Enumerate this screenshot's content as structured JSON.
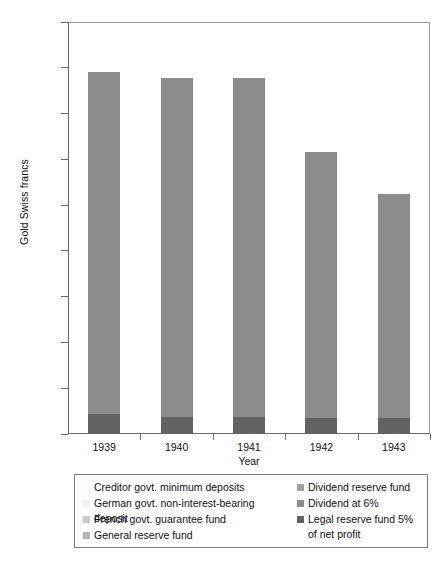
{
  "chart_data": {
    "type": "bar",
    "stacked": true,
    "title": "",
    "xlabel": "Year",
    "ylabel": "Gold Swiss francs",
    "categories": [
      "1939",
      "1940",
      "1941",
      "1942",
      "1943"
    ],
    "ylim": [
      0,
      9000000
    ],
    "ytick_values": [
      0,
      1000000,
      2000000,
      3000000,
      4000000,
      5000000,
      6000000,
      7000000,
      8000000,
      9000000
    ],
    "ytick_labels": [
      "0",
      "1,000,000",
      "2,000,000",
      "3,000,000",
      "4,000,000",
      "5,000,000",
      "6,000,000",
      "7,000,000",
      "8,000,000",
      "9,000,000"
    ],
    "grid": false,
    "legend_position": "below-plot",
    "totals": [
      7900000,
      7770000,
      7770000,
      6150000,
      5250000
    ],
    "series": [
      {
        "name": "Creditor govt. minimum deposits",
        "color": "#ffffff",
        "values": [
          0,
          0,
          0,
          0,
          0
        ]
      },
      {
        "name": "German govt. non-interest-bearing deposit",
        "color": "#efefef",
        "values": [
          0,
          0,
          0,
          0,
          0
        ]
      },
      {
        "name": "French govt. guarantee fund",
        "color": "#c9c9c9",
        "values": [
          0,
          0,
          0,
          0,
          0
        ]
      },
      {
        "name": "General reserve fund",
        "color": "#b4b4b4",
        "values": [
          0,
          0,
          0,
          0,
          0
        ]
      },
      {
        "name": "Dividend reserve fund",
        "color": "#a0a0a0",
        "values": [
          0,
          0,
          0,
          0,
          0
        ]
      },
      {
        "name": "Dividend at 6%",
        "color": "#8c8c8c",
        "values": [
          7470000,
          7390000,
          7400000,
          5790000,
          4890000
        ]
      },
      {
        "name": "Legal reserve fund 5% of net profit",
        "color": "#636363",
        "values": [
          430000,
          380000,
          370000,
          360000,
          360000
        ]
      }
    ]
  },
  "legend": {
    "columns": [
      {
        "items": [
          {
            "label": "Creditor govt. minimum deposits",
            "color": "#ffffff"
          },
          {
            "label": "German govt. non-interest-bearing deposit",
            "color": "#efefef"
          },
          {
            "label": "French govt. guarantee fund",
            "color": "#c9c9c9"
          },
          {
            "label": "General reserve fund",
            "color": "#b4b4b4"
          }
        ]
      },
      {
        "items": [
          {
            "label": "Dividend reserve fund",
            "color": "#a0a0a0"
          },
          {
            "label": "Dividend at 6%",
            "color": "#8c8c8c"
          },
          {
            "label": "Legal reserve fund 5%\nof net profit",
            "color": "#636363"
          }
        ]
      }
    ]
  }
}
